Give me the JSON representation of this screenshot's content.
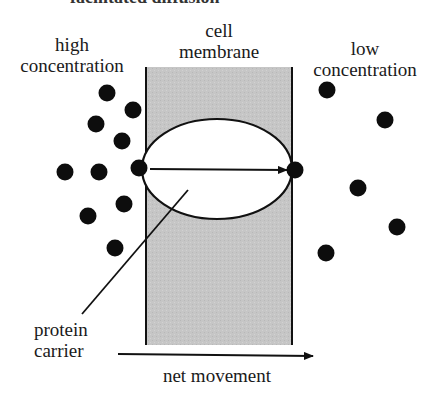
{
  "diagram": {
    "title": "facilitated diffusion",
    "labels": {
      "high_line1": "high",
      "high_line2": "concentration",
      "membrane_line1": "cell",
      "membrane_line2": "membrane",
      "low_line1": "low",
      "low_line2": "concentration",
      "protein_line1": "protein",
      "protein_line2": "carrier",
      "net_movement": "net movement"
    },
    "colors": {
      "membrane_fill": "#c6c6c6",
      "ink": "#111111",
      "carrier_fill": "#ffffff"
    },
    "membrane": {
      "x": 146,
      "y": 67,
      "width": 146,
      "height": 278
    },
    "carrier": {
      "cx": 217,
      "cy": 169,
      "rx": 75,
      "ry": 50
    },
    "molecules_high": [
      {
        "x": 107,
        "y": 93
      },
      {
        "x": 133,
        "y": 110
      },
      {
        "x": 96,
        "y": 124
      },
      {
        "x": 122,
        "y": 141
      },
      {
        "x": 65,
        "y": 172
      },
      {
        "x": 99,
        "y": 172
      },
      {
        "x": 124,
        "y": 204
      },
      {
        "x": 88,
        "y": 216
      },
      {
        "x": 115,
        "y": 248
      }
    ],
    "molecules_in_transit": [
      {
        "x": 139,
        "y": 168
      },
      {
        "x": 295,
        "y": 170
      }
    ],
    "molecules_low": [
      {
        "x": 327,
        "y": 90
      },
      {
        "x": 385,
        "y": 120
      },
      {
        "x": 358,
        "y": 188
      },
      {
        "x": 397,
        "y": 227
      },
      {
        "x": 326,
        "y": 253
      }
    ]
  }
}
